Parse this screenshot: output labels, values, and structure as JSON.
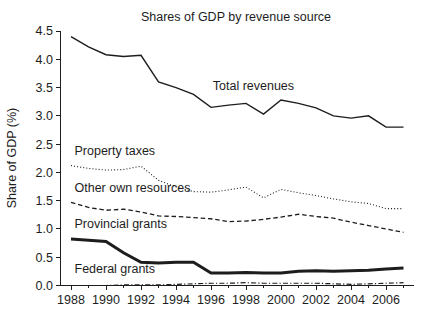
{
  "chart_data": {
    "type": "line",
    "title": "Shares of GDP by revenue source",
    "xlabel": "",
    "ylabel": "Share of GDP (%)",
    "xlim": [
      1987.4,
      2007.6
    ],
    "ylim": [
      0.0,
      4.5
    ],
    "grid": false,
    "legend_position": "inline-annotations",
    "x": [
      1988,
      1989,
      1990,
      1991,
      1992,
      1993,
      1994,
      1995,
      1996,
      1997,
      1998,
      1999,
      2000,
      2001,
      2002,
      2003,
      2004,
      2005,
      2006,
      2007
    ],
    "x_tick_labels": [
      "1988",
      "1990",
      "1992",
      "1994",
      "1996",
      "1998",
      "2000",
      "2002",
      "2004",
      "2006"
    ],
    "x_tick_values": [
      1988,
      1990,
      1992,
      1994,
      1996,
      1998,
      2000,
      2002,
      2004,
      2006
    ],
    "x_minor_tick_values": [
      1989,
      1991,
      1993,
      1995,
      1997,
      1999,
      2001,
      2003,
      2005,
      2007
    ],
    "y_tick_labels": [
      "0.0",
      "0.5",
      "1.0",
      "1.5",
      "2.0",
      "2.5",
      "3.0",
      "3.5",
      "4.0",
      "4.5"
    ],
    "y_tick_values": [
      0.0,
      0.5,
      1.0,
      1.5,
      2.0,
      2.5,
      3.0,
      3.5,
      4.0,
      4.5
    ],
    "series": [
      {
        "name": "Total revenues",
        "style": "solid",
        "color": "#1d1d1d",
        "width": 1.4,
        "label_x": 1996.1,
        "label_y": 3.46,
        "values": [
          4.4,
          4.22,
          4.08,
          4.05,
          4.07,
          3.6,
          3.5,
          3.38,
          3.15,
          3.19,
          3.22,
          3.03,
          3.28,
          3.22,
          3.14,
          3.0,
          2.96,
          3.0,
          2.8,
          2.8
        ]
      },
      {
        "name": "Property taxes",
        "style": "dotted",
        "color": "#1d1d1d",
        "width": 1.1,
        "label_x": 1988.2,
        "label_y": 2.3,
        "values": [
          2.12,
          2.07,
          2.04,
          2.05,
          2.11,
          1.86,
          1.74,
          1.66,
          1.65,
          1.69,
          1.74,
          1.55,
          1.7,
          1.64,
          1.59,
          1.53,
          1.48,
          1.45,
          1.36,
          1.36
        ]
      },
      {
        "name": "Other own resources",
        "style": "dashed",
        "color": "#1d1d1d",
        "width": 1.3,
        "label_x": 1988.2,
        "label_y": 1.66,
        "values": [
          1.47,
          1.38,
          1.33,
          1.35,
          1.3,
          1.23,
          1.22,
          1.2,
          1.18,
          1.13,
          1.14,
          1.17,
          1.21,
          1.26,
          1.22,
          1.19,
          1.12,
          1.06,
          1.0,
          0.94
        ]
      },
      {
        "name": "Provincial grants",
        "style": "thick-solid",
        "color": "#1d1d1d",
        "width": 3.0,
        "label_x": 1988.2,
        "label_y": 1.02,
        "values": [
          0.82,
          0.8,
          0.78,
          0.58,
          0.41,
          0.4,
          0.41,
          0.41,
          0.22,
          0.22,
          0.23,
          0.22,
          0.22,
          0.25,
          0.26,
          0.25,
          0.26,
          0.27,
          0.29,
          0.31
        ]
      },
      {
        "name": "Federal grants",
        "style": "dash-dot",
        "color": "#1d1d1d",
        "width": 1.2,
        "label_x": 1988.2,
        "label_y": 0.22,
        "values": [
          0.0,
          0.0,
          0.0,
          0.01,
          0.01,
          0.01,
          0.02,
          0.03,
          0.04,
          0.04,
          0.05,
          0.04,
          0.04,
          0.04,
          0.04,
          0.03,
          0.02,
          0.03,
          0.04,
          0.05
        ]
      }
    ]
  }
}
